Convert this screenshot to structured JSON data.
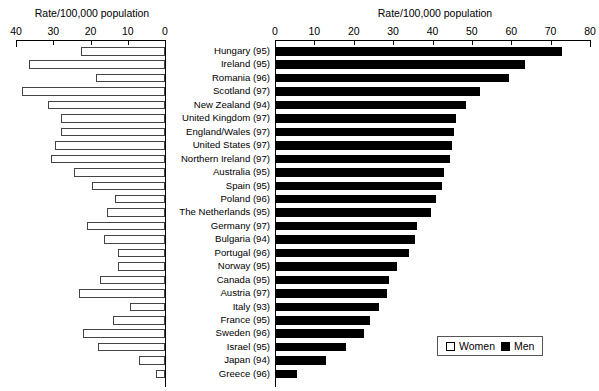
{
  "chart_data": {
    "type": "bar",
    "orientation": "horizontal",
    "style": "population-pyramid-paired-bars",
    "title": "",
    "left_panel": {
      "axis_title": "Rate/100,000 population",
      "series_name": "Women",
      "ticks": [
        40,
        30,
        20,
        10,
        0
      ],
      "xlim": [
        40,
        0
      ],
      "direction": "right-to-left"
    },
    "right_panel": {
      "axis_title": "Rate/100,000 population",
      "series_name": "Men",
      "ticks": [
        0,
        10,
        20,
        30,
        40,
        50,
        60,
        70,
        80
      ],
      "xlim": [
        0,
        80
      ],
      "direction": "left-to-right"
    },
    "categories": [
      "Hungary (95)",
      "Ireland (95)",
      "Romania (96)",
      "Scotland (97)",
      "New Zealand (94)",
      "United Kingdom (97)",
      "England/Wales (97)",
      "United States (97)",
      "Northern Ireland (97)",
      "Australia (95)",
      "Spain (95)",
      "Poland (96)",
      "The Netherlands (95)",
      "Germany (97)",
      "Bulgaria (94)",
      "Portugal (96)",
      "Norway (95)",
      "Canada (95)",
      "Austria (97)",
      "Italy (93)",
      "France (95)",
      "Sweden (96)",
      "Israel (95)",
      "Japan (94)",
      "Greece (96)"
    ],
    "series": [
      {
        "name": "Women",
        "color": "#ffffff",
        "values": [
          22.5,
          36.5,
          18.5,
          38.5,
          31.5,
          28.0,
          28.0,
          29.5,
          30.5,
          24.5,
          19.5,
          13.5,
          15.5,
          21.0,
          16.5,
          12.5,
          12.5,
          17.5,
          23.0,
          9.5,
          14.0,
          22.0,
          18.0,
          7.0,
          2.5
        ]
      },
      {
        "name": "Men",
        "color": "#000000",
        "values": [
          73.0,
          63.5,
          59.5,
          52.0,
          48.5,
          46.0,
          45.5,
          45.0,
          44.5,
          43.0,
          42.5,
          41.0,
          39.5,
          36.0,
          35.5,
          34.0,
          31.0,
          29.0,
          28.5,
          26.5,
          24.0,
          22.5,
          18.0,
          13.0,
          5.5
        ]
      }
    ],
    "legend": {
      "position": "bottom-right",
      "entries": [
        {
          "label": "Women",
          "swatch": "white-square"
        },
        {
          "label": "Men",
          "swatch": "black-square"
        }
      ]
    },
    "grid": false
  }
}
